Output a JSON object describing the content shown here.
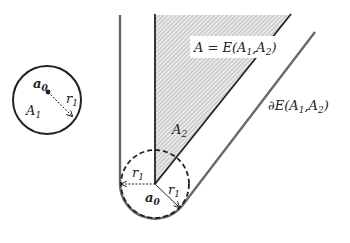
{
  "figure": {
    "small_circle": {
      "center_label": "a",
      "center_label_sub": "0",
      "region_label": "A",
      "region_label_sub": "1",
      "radius_label": "r",
      "radius_label_sub": "1"
    },
    "region_A2": {
      "label": "A",
      "label_sub": "2"
    },
    "equation": {
      "lhs": "A = E(A",
      "sub1": "1",
      "mid": ",A",
      "sub2": "2",
      "rhs": ")"
    },
    "boundary": {
      "prefix": "∂E(A",
      "sub1": "1",
      "mid": ",A",
      "sub2": "2",
      "rhs": ")"
    },
    "base_point": {
      "label": "a",
      "label_sub": "0",
      "left_radius_label": "r",
      "left_radius_sub": "1",
      "right_radius_label": "r",
      "right_radius_sub": "1"
    },
    "colors": {
      "stroke": "#222222",
      "boundary_stroke": "#666666",
      "hatch": "#9a9a9a",
      "hatch_bg": "#e6e6e6"
    }
  }
}
